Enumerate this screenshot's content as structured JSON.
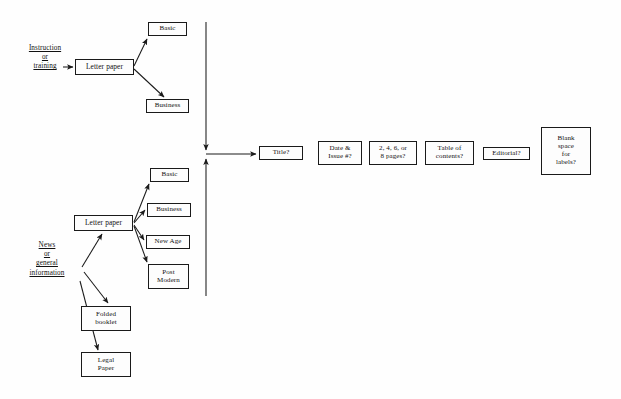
{
  "diagram": {
    "type": "flowchart",
    "canvas": {
      "width": 621,
      "height": 399
    },
    "colors": {
      "background": "#fefefe",
      "stroke": "#1a1a1a",
      "box_fill": "#fdfdfd",
      "text": "#111111"
    },
    "sources": [
      {
        "id": "source-instruction",
        "lines": [
          "Instruction",
          "or",
          "training"
        ],
        "x": 14,
        "y": 44,
        "width": 62,
        "font_size": 7.2
      },
      {
        "id": "source-news",
        "lines": [
          "News",
          "or",
          "general",
          "information"
        ],
        "x": 14,
        "y": 241,
        "width": 66,
        "font_size": 7.2
      }
    ],
    "nodes": [
      {
        "id": "letter-paper-top",
        "label": "Letter paper",
        "x": 75,
        "y": 59,
        "width": 59,
        "height": 16,
        "font_size": 7.4
      },
      {
        "id": "basic-top",
        "label": "Basic",
        "x": 148,
        "y": 22,
        "width": 39,
        "height": 14,
        "font_size": 7.0
      },
      {
        "id": "business-top",
        "label": "Business",
        "x": 146,
        "y": 99,
        "width": 43,
        "height": 14,
        "font_size": 7.0
      },
      {
        "id": "letter-paper-bottom",
        "label": "Letter paper",
        "x": 74,
        "y": 215,
        "width": 59,
        "height": 16,
        "font_size": 7.4
      },
      {
        "id": "basic-bottom",
        "label": "Basic",
        "x": 150,
        "y": 168,
        "width": 39,
        "height": 14,
        "font_size": 7.0
      },
      {
        "id": "business-bottom",
        "label": "Business",
        "x": 147,
        "y": 203,
        "width": 44,
        "height": 14,
        "font_size": 7.0
      },
      {
        "id": "new-age",
        "label": "New Age",
        "x": 146,
        "y": 235,
        "width": 44,
        "height": 14,
        "font_size": 7.0
      },
      {
        "id": "post-modern",
        "label": "Post\nModern",
        "x": 148,
        "y": 264,
        "width": 41,
        "height": 25,
        "font_size": 7.0
      },
      {
        "id": "folded-booklet",
        "label": "Folded\nbooklet",
        "x": 81,
        "y": 306,
        "width": 50,
        "height": 25,
        "font_size": 7.0
      },
      {
        "id": "legal-paper",
        "label": "Legal\nPaper",
        "x": 81,
        "y": 352,
        "width": 50,
        "height": 25,
        "font_size": 7.0
      },
      {
        "id": "title-question",
        "label": "Title?",
        "x": 259,
        "y": 146,
        "width": 44,
        "height": 14,
        "font_size": 7.0
      },
      {
        "id": "date-issue-question",
        "label": "Date &\nIssue #?",
        "x": 318,
        "y": 141,
        "width": 44,
        "height": 24,
        "font_size": 7.0
      },
      {
        "id": "pages-question",
        "label": "2, 4, 6, or\n8 pages?",
        "x": 369,
        "y": 141,
        "width": 48,
        "height": 24,
        "font_size": 7.0
      },
      {
        "id": "toc-question",
        "label": "Table of\ncontents?",
        "x": 425,
        "y": 141,
        "width": 49,
        "height": 24,
        "font_size": 7.0
      },
      {
        "id": "editorial-question",
        "label": "Editorial?",
        "x": 483,
        "y": 147,
        "width": 47,
        "height": 13,
        "font_size": 7.0
      },
      {
        "id": "blank-space-question",
        "label": "Blank\nspace\nfor\nlabels?",
        "x": 541,
        "y": 127,
        "width": 50,
        "height": 48,
        "font_size": 7.0
      }
    ],
    "connectors": [
      {
        "id": "arrow-instruction-to-letter",
        "from": "source-instruction",
        "to": "letter-paper-top",
        "points": "63,67 73,67"
      },
      {
        "id": "arrow-letter-top-to-basic",
        "from": "letter-paper-top",
        "to": "basic-top",
        "points": "134,66 146,39"
      },
      {
        "id": "arrow-letter-top-to-business",
        "from": "letter-paper-top",
        "to": "business-top",
        "points": "134,68 164,97"
      },
      {
        "id": "spine-down",
        "from": "top-branch",
        "to": "junction",
        "points": "206,22 206,150"
      },
      {
        "id": "spine-up",
        "from": "bottom-branch",
        "to": "junction",
        "points": "206,296 206,158"
      },
      {
        "id": "arrow-junction-to-title",
        "from": "junction",
        "to": "title-question",
        "points": "206,154 256,154"
      },
      {
        "id": "arrow-news-to-letter",
        "from": "source-news",
        "to": "letter-paper-bottom",
        "points": "82,266 102,233"
      },
      {
        "id": "arrow-news-to-folded",
        "from": "source-news",
        "to": "folded-booklet",
        "points": "84,272 108,310"
      },
      {
        "id": "arrow-news-to-legal",
        "from": "source-news",
        "to": "legal-paper",
        "points": "80,281 98,356"
      },
      {
        "id": "arrow-letter-bottom-to-basic",
        "from": "letter-paper-bottom",
        "to": "basic-bottom",
        "points": "134,222 148,183"
      },
      {
        "id": "arrow-letter-bottom-to-business",
        "from": "letter-paper-bottom",
        "to": "business-bottom",
        "points": "134,223 145,209"
      },
      {
        "id": "arrow-letter-bottom-to-newage",
        "from": "letter-paper-bottom",
        "to": "new-age",
        "points": "134,225 144,240"
      },
      {
        "id": "arrow-letter-bottom-to-postmodern",
        "from": "letter-paper-bottom",
        "to": "post-modern",
        "points": "134,226 146,263"
      }
    ]
  }
}
